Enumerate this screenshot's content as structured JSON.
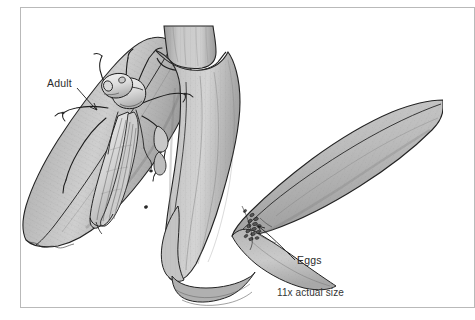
{
  "figure": {
    "type": "scientific-line-illustration",
    "background_color": "#ffffff",
    "frame_color": "#b9b9b9",
    "ink_color": "#1d1d1d",
    "leaf_fill_light": "#d8d8d8",
    "leaf_fill_mid": "#bdbdbd",
    "leaf_fill_dark": "#9b9b9b",
    "labels": {
      "adult": "Adult",
      "eggs": "Eggs",
      "scale": "11x actual size"
    },
    "label_colors": {
      "text": "#2b2b2b",
      "leader_line": "#1d1d1d"
    },
    "subjects": [
      {
        "name": "adult-insect",
        "description": "Winged adult leafhopper resting head-up on left leaf blade",
        "label": "Adult"
      },
      {
        "name": "egg-mass",
        "description": "Cluster of small oval eggs inserted at leaf sheath junction",
        "label": "Eggs"
      },
      {
        "name": "grass-plant",
        "description": "Grass culm with node, two leaf blades and sheaths"
      }
    ]
  }
}
